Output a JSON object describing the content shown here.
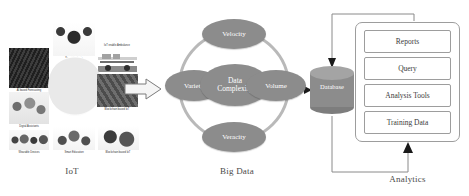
{
  "diagram": {
    "sections": {
      "iot": {
        "label": "IoT"
      },
      "bigdata": {
        "label": "Big Data"
      },
      "analytics": {
        "label": "Analytics"
      }
    },
    "iot_tiles": [
      {
        "name": "ai-based-forecasting",
        "caption": "AI based Forecasting"
      },
      {
        "name": "smart-gadgets",
        "caption": "Smart Gadgets"
      },
      {
        "name": "iot-enable-ambulance",
        "caption": "IoT enable Ambulance"
      },
      {
        "name": "digital-assistants",
        "caption": "Digital Assistants"
      },
      {
        "name": "globe-connectivity",
        "caption": ""
      },
      {
        "name": "blockchain-based-iot",
        "caption": "Blockchain based IoT"
      },
      {
        "name": "wearable-devices",
        "caption": "Wearable Devices"
      },
      {
        "name": "smart-education",
        "caption": "Smart Education"
      },
      {
        "name": "smart-logistics",
        "caption": "Blockchain based IoT"
      }
    ],
    "bigdata_nodes": {
      "top": "Velocity",
      "left": "Variety",
      "center": "Data\nComplexity",
      "center_line1": "Data",
      "center_line2": "Complexity",
      "right": "Volume",
      "bottom": "Veracity"
    },
    "database": {
      "label": "Database"
    },
    "analytics_items": [
      {
        "label": "Reports"
      },
      {
        "label": "Query"
      },
      {
        "label": "Analysis Tools"
      },
      {
        "label": "Training Data"
      }
    ],
    "colors": {
      "ellipse_fill": "#8c8c8c",
      "ring_stroke": "#b9b9b9",
      "cylinder_fill": "#8c8c8c",
      "box_stroke": "#9d9d9d",
      "arrow_fill": "#1a1a1a",
      "page_bg": "#ffffff",
      "text": "#3a3a3a"
    }
  }
}
